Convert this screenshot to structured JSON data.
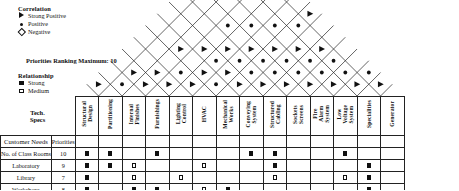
{
  "legend": {
    "correlation": {
      "title": "Correlation",
      "items": [
        {
          "symbol": "strong-positive-triangle",
          "label": "Strong Positive"
        },
        {
          "symbol": "positive-dot",
          "label": "Positive"
        },
        {
          "symbol": "negative-diamond",
          "label": "Negative"
        }
      ]
    },
    "priorities_note": "Priorities Ranking Maximum: 10",
    "relationship": {
      "title": "Relationship",
      "items": [
        {
          "symbol": "strong-filled-square",
          "label": "Strong"
        },
        {
          "symbol": "medium-open-square",
          "label": "Medium"
        },
        {
          "symbol": "weak-diamond",
          "label": "Weak"
        }
      ]
    }
  },
  "table": {
    "tech_specs_header": "Tech.\nSpecs",
    "priorities_header": "Priorities",
    "customer_needs_header": "Customer Needs",
    "columns": [
      "Structural Design",
      "Partitioning",
      "Internal Finishes",
      "Furnishings",
      "Lighting Control",
      "HVAC",
      "Mechanical Works",
      "Conveying System",
      "Structured Cabling",
      "Sockets Screens",
      "Fire Alarm System",
      "Low Voltage System",
      "Specialities",
      "Generator"
    ],
    "rows": [
      {
        "need": "No. of Class Rooms",
        "priority": "10",
        "cells": [
          "strong",
          "strong",
          "",
          "strong",
          "",
          "",
          "",
          "strong",
          "strong",
          "",
          "",
          "strong",
          "",
          ""
        ]
      },
      {
        "need": "Laboratory",
        "priority": "9",
        "cells": [
          "strong",
          "strong",
          "medium",
          "",
          "",
          "medium",
          "",
          "",
          "strong",
          "",
          "",
          "",
          "strong",
          ""
        ]
      },
      {
        "need": "Library",
        "priority": "7",
        "cells": [
          "strong",
          "",
          "medium",
          "",
          "medium",
          "",
          "",
          "",
          "medium",
          "",
          "",
          "medium",
          "strong",
          ""
        ]
      },
      {
        "need": "Workshops",
        "priority": "8",
        "cells": [
          "strong",
          "",
          "strong",
          "strong",
          "",
          "medium",
          "strong",
          "",
          "",
          "",
          "",
          "",
          "strong",
          ""
        ]
      },
      {
        "need": "Auditorium",
        "priority": "7",
        "cells": [
          "strong",
          "",
          "strong",
          "strong",
          "medium",
          "medium",
          "",
          "",
          "medium",
          "",
          "",
          "medium",
          "strong",
          ""
        ]
      }
    ]
  },
  "roof": {
    "description": "Correlation roof matrix",
    "marks": [
      {
        "col_a": 0,
        "col_b": 1,
        "type": "strong-positive"
      },
      {
        "col_a": 1,
        "col_b": 2,
        "type": "positive"
      },
      {
        "col_a": 1,
        "col_b": 3,
        "type": "strong-positive"
      },
      {
        "col_a": 2,
        "col_b": 3,
        "type": "strong-positive"
      },
      {
        "col_a": 2,
        "col_b": 4,
        "type": "strong-positive"
      },
      {
        "col_a": 3,
        "col_b": 4,
        "type": "strong-positive"
      },
      {
        "col_a": 3,
        "col_b": 5,
        "type": "positive"
      },
      {
        "col_a": 4,
        "col_b": 5,
        "type": "strong-positive"
      },
      {
        "col_a": 4,
        "col_b": 6,
        "type": "strong-positive"
      },
      {
        "col_a": 5,
        "col_b": 6,
        "type": "positive"
      },
      {
        "col_a": 5,
        "col_b": 7,
        "type": "strong-positive"
      },
      {
        "col_a": 6,
        "col_b": 7,
        "type": "strong-positive"
      },
      {
        "col_a": 6,
        "col_b": 8,
        "type": "positive"
      },
      {
        "col_a": 7,
        "col_b": 8,
        "type": "strong-positive"
      },
      {
        "col_a": 7,
        "col_b": 9,
        "type": "positive"
      },
      {
        "col_a": 8,
        "col_b": 9,
        "type": "strong-positive"
      },
      {
        "col_a": 8,
        "col_b": 10,
        "type": "positive"
      },
      {
        "col_a": 9,
        "col_b": 10,
        "type": "strong-positive"
      },
      {
        "col_a": 9,
        "col_b": 11,
        "type": "positive"
      },
      {
        "col_a": 10,
        "col_b": 11,
        "type": "strong-positive"
      },
      {
        "col_a": 10,
        "col_b": 12,
        "type": "positive"
      },
      {
        "col_a": 11,
        "col_b": 12,
        "type": "strong-positive"
      },
      {
        "col_a": 11,
        "col_b": 13,
        "type": "positive"
      },
      {
        "col_a": 12,
        "col_b": 13,
        "type": "strong-positive"
      },
      {
        "col_a": 2,
        "col_b": 6,
        "type": "strong-positive"
      },
      {
        "col_a": 3,
        "col_b": 7,
        "type": "strong-positive"
      },
      {
        "col_a": 4,
        "col_b": 8,
        "type": "strong-positive"
      },
      {
        "col_a": 5,
        "col_b": 9,
        "type": "strong-positive"
      },
      {
        "col_a": 6,
        "col_b": 10,
        "type": "strong-positive"
      },
      {
        "col_a": 7,
        "col_b": 11,
        "type": "strong-positive"
      },
      {
        "col_a": 8,
        "col_b": 12,
        "type": "strong-positive"
      },
      {
        "col_a": 5,
        "col_b": 11,
        "type": "positive"
      },
      {
        "col_a": 6,
        "col_b": 12,
        "type": "positive"
      },
      {
        "col_a": 4,
        "col_b": 10,
        "type": "positive"
      },
      {
        "col_a": 3,
        "col_b": 9,
        "type": "positive"
      },
      {
        "col_a": 6,
        "col_b": 9,
        "type": "positive"
      },
      {
        "col_a": 5,
        "col_b": 8,
        "type": "positive"
      },
      {
        "col_a": 7,
        "col_b": 10,
        "type": "positive"
      },
      {
        "col_a": 4,
        "col_b": 7,
        "type": "positive"
      },
      {
        "col_a": 8,
        "col_b": 11,
        "type": "positive"
      },
      {
        "col_a": 6,
        "col_b": 13,
        "type": "strong-positive"
      },
      {
        "col_a": 9,
        "col_b": 12,
        "type": "positive"
      }
    ]
  },
  "geometry": {
    "col_width": 22.5,
    "grid_left": 108,
    "roof_baseline_y": 96,
    "num_columns": 14
  }
}
